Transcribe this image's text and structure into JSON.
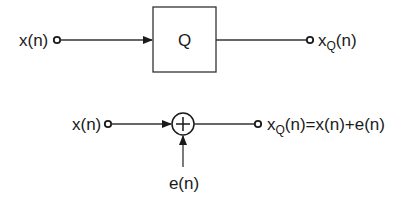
{
  "diagram": {
    "type": "block-diagram",
    "colors": {
      "stroke": "#333333",
      "text": "#1a1a1a",
      "background": "#ffffff"
    },
    "top": {
      "input_label": "x(n)",
      "block_label": "Q",
      "output_label_base": "x",
      "output_label_sub": "Q",
      "output_label_rest": "(n)"
    },
    "bottom": {
      "input_label": "x(n)",
      "adder_symbol": "+",
      "noise_label": "e(n)",
      "output_label_base": "x",
      "output_label_sub": "Q",
      "output_label_rest": "(n)=x(n)+e(n)"
    }
  }
}
